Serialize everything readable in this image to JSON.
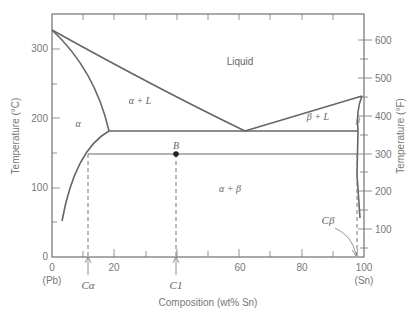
{
  "diagram": {
    "x_axis": {
      "label": "Composition (wt% Sn)",
      "ticks": [
        "0",
        "20",
        "60",
        "80",
        "100"
      ],
      "left_end": "(Pb)",
      "right_end": "(Sn)"
    },
    "y_axis_left": {
      "label": "Temperature (°C)",
      "ticks": [
        "0",
        "100",
        "200",
        "300"
      ]
    },
    "y_axis_right": {
      "label": "Temperature (°F)",
      "ticks": [
        "100",
        "200",
        "300",
        "400",
        "500",
        "600"
      ]
    },
    "regions": {
      "liquid": "Liquid",
      "alpha_l": "α + L",
      "beta_l": "β + L",
      "alpha": "α",
      "beta": "β",
      "alpha_beta": "α + β"
    },
    "markers": {
      "point_b": "B",
      "c_alpha": "Cα",
      "c1": "C1",
      "c_beta": "Cβ"
    },
    "key_points": {
      "pb_melting_c": 327,
      "sn_melting_c": 232,
      "eutectic_temp_c": 183,
      "eutectic_comp_wt_sn": 61.9,
      "alpha_max_solubility_wt_sn": 18.3,
      "beta_max_solubility_wt_sn": 97.8,
      "point_b": {
        "comp_wt_sn": 40,
        "temp_c": 150
      }
    }
  }
}
